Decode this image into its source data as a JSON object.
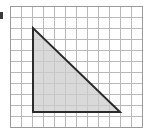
{
  "figure": {
    "background_color": "#ffffff"
  },
  "grid": {
    "name": "square-grid",
    "origin_x": 10,
    "origin_y": 6,
    "cell_size": 11,
    "columns": 12,
    "rows": 11,
    "line_color": "#b9b9b9",
    "line_width": 1,
    "border_color": "#9a9a9a",
    "border_width": 1
  },
  "shape": {
    "name": "right-triangle",
    "type": "triangle",
    "fill_color": "#cccccc",
    "fill_opacity": 0.75,
    "stroke_color": "#2b2b2b",
    "stroke_width": 2,
    "points_px": "33,28 33,112 120,112",
    "vertices_px": [
      {
        "label": "apex",
        "x": 33,
        "y": 28
      },
      {
        "label": "right-angle",
        "x": 33,
        "y": 112
      },
      {
        "label": "base-right",
        "x": 120,
        "y": 112
      }
    ],
    "vertices_cells": [
      {
        "label": "apex",
        "col": 2,
        "row": 2
      },
      {
        "label": "right-angle",
        "col": 2,
        "row": 10
      },
      {
        "label": "base-right",
        "col": 10,
        "row": 10
      }
    ],
    "legs_in_cells": {
      "vertical": 8,
      "horizontal": 8
    },
    "area_in_cells": 32
  },
  "artifact": {
    "name": "left-edge-mark",
    "color": "#3a3a3a",
    "x": 0,
    "y": 12,
    "width": 3,
    "height": 7
  }
}
